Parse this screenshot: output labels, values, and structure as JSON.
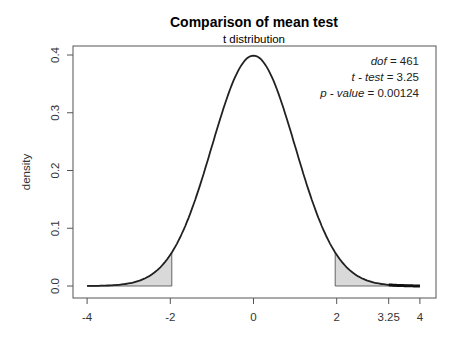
{
  "chart_data": {
    "type": "area",
    "title": "Comparison of mean test",
    "subtitle": "t distribution",
    "xlabel": "",
    "ylabel": "density",
    "xlim": [
      -4,
      4
    ],
    "ylim": [
      0,
      0.4
    ],
    "x_ticks": [
      -4,
      -2,
      0,
      2,
      3.25,
      4
    ],
    "x_tick_labels": [
      "-4",
      "-2",
      "0",
      "2",
      "3.25",
      "4"
    ],
    "y_ticks": [
      0.0,
      0.1,
      0.2,
      0.3,
      0.4
    ],
    "y_tick_labels": [
      "0.0",
      "0.1",
      "0.2",
      "0.3",
      "0.4"
    ],
    "grid": false,
    "distribution": {
      "name": "t",
      "dof": 461
    },
    "critical_regions": [
      {
        "from": -4,
        "to": -1.965,
        "fill": "#d9d9d9"
      },
      {
        "from": 1.965,
        "to": 4,
        "fill": "#d9d9d9"
      }
    ],
    "highlighted_tail": {
      "from": 3.25,
      "to": 4
    },
    "test_statistic": 3.25,
    "annotations": [
      {
        "label": "dof",
        "value": "461"
      },
      {
        "label": "t - test",
        "value": "3.25"
      },
      {
        "label": "p - value",
        "value": "0.00124"
      }
    ],
    "sample_points": {
      "x": [
        -4,
        -3,
        -2,
        -1,
        0,
        1,
        2,
        3,
        4
      ],
      "density": [
        0.0001,
        0.0045,
        0.054,
        0.242,
        0.399,
        0.242,
        0.054,
        0.0045,
        0.0001
      ]
    }
  },
  "colors": {
    "curve": "#222222",
    "shade": "#d9d9d9",
    "axis": "#555555"
  }
}
